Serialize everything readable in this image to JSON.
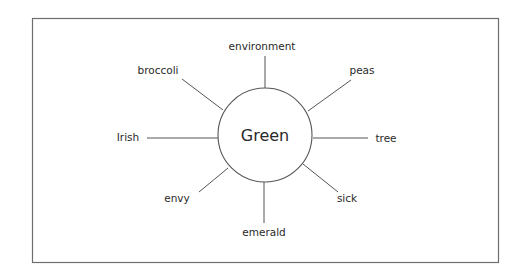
{
  "diagram": {
    "type": "concept-web",
    "center": {
      "label": "Green"
    },
    "nodes": [
      {
        "id": "environment",
        "label": "environment"
      },
      {
        "id": "peas",
        "label": "peas"
      },
      {
        "id": "tree",
        "label": "tree"
      },
      {
        "id": "sick",
        "label": "sick"
      },
      {
        "id": "emerald",
        "label": "emerald"
      },
      {
        "id": "envy",
        "label": "envy"
      },
      {
        "id": "irish",
        "label": "Irish"
      },
      {
        "id": "broccoli",
        "label": "broccoli"
      }
    ],
    "colors": {
      "line": "#555555",
      "text": "#2a2a2a",
      "frame": "#6e6e6e",
      "background": "#ffffff"
    }
  }
}
